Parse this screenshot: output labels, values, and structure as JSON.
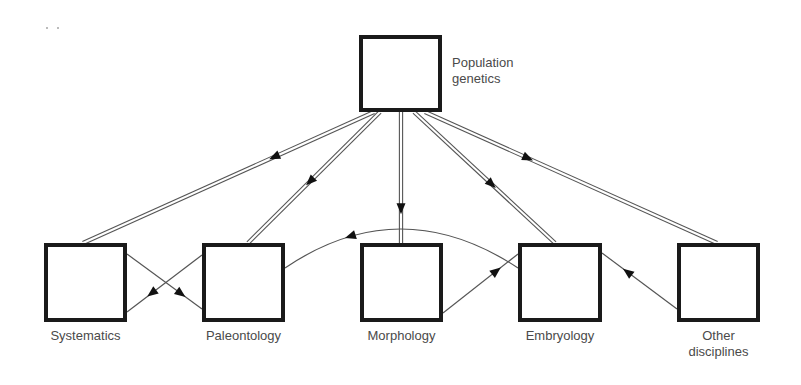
{
  "diagram": {
    "nodes": [
      {
        "id": "population-genetics",
        "label_lines": [
          "Population",
          "genetics"
        ],
        "x": 359,
        "y": 35,
        "w": 83,
        "h": 77,
        "label_pos": "right"
      },
      {
        "id": "systematics",
        "label_lines": [
          "Systematics"
        ],
        "x": 44,
        "y": 243,
        "w": 83,
        "h": 79,
        "label_pos": "below"
      },
      {
        "id": "paleontology",
        "label_lines": [
          "Paleontology"
        ],
        "x": 202,
        "y": 243,
        "w": 83,
        "h": 79,
        "label_pos": "below"
      },
      {
        "id": "morphology",
        "label_lines": [
          "Morphology"
        ],
        "x": 360,
        "y": 243,
        "w": 83,
        "h": 79,
        "label_pos": "below"
      },
      {
        "id": "embryology",
        "label_lines": [
          "Embryology"
        ],
        "x": 518,
        "y": 243,
        "w": 84,
        "h": 79,
        "label_pos": "below"
      },
      {
        "id": "other-disciplines",
        "label_lines": [
          "Other",
          "disciplines"
        ],
        "x": 677,
        "y": 243,
        "w": 83,
        "h": 79,
        "label_pos": "below"
      }
    ],
    "edges": [
      {
        "from": "population-genetics",
        "to": "systematics",
        "style": "double",
        "x1": 374,
        "y1": 112,
        "x2": 83,
        "y2": 243,
        "arrow_t": 0.36
      },
      {
        "from": "population-genetics",
        "to": "paleontology",
        "style": "double",
        "x1": 380,
        "y1": 112,
        "x2": 248,
        "y2": 243,
        "arrow_t": 0.56
      },
      {
        "from": "population-genetics",
        "to": "morphology",
        "style": "double",
        "x1": 401,
        "y1": 112,
        "x2": 401,
        "y2": 243,
        "arrow_t": 0.78
      },
      {
        "from": "population-genetics",
        "to": "embryology",
        "style": "double",
        "x1": 414,
        "y1": 112,
        "x2": 555,
        "y2": 243,
        "arrow_t": 0.58
      },
      {
        "from": "population-genetics",
        "to": "other-disciplines",
        "style": "double",
        "x1": 425,
        "y1": 112,
        "x2": 717,
        "y2": 243,
        "arrow_t": 0.37
      },
      {
        "from": "systematics",
        "to": "paleontology",
        "style": "single",
        "x1": 127,
        "y1": 254,
        "x2": 202,
        "y2": 309,
        "arrow_t": 0.78
      },
      {
        "from": "paleontology",
        "to": "systematics",
        "style": "single",
        "x1": 202,
        "y1": 255,
        "x2": 127,
        "y2": 312,
        "arrow_t": 0.73
      },
      {
        "from": "morphology",
        "to": "embryology",
        "style": "single",
        "x1": 443,
        "y1": 313,
        "x2": 518,
        "y2": 254,
        "arrow_t": 0.77
      },
      {
        "from": "other-disciplines",
        "to": "embryology",
        "style": "single",
        "x1": 677,
        "y1": 309,
        "x2": 602,
        "y2": 253,
        "arrow_t": 0.72
      },
      {
        "from": "embryology",
        "to": "paleontology",
        "style": "arc",
        "x1": 518,
        "y1": 268,
        "cx": 400,
        "cy": 190,
        "x2": 285,
        "y2": 268,
        "arrow_t": 0.74
      }
    ],
    "colors": {
      "box_border": "#1a1a1a",
      "line": "#555555",
      "label": "#4a4a4a"
    }
  }
}
